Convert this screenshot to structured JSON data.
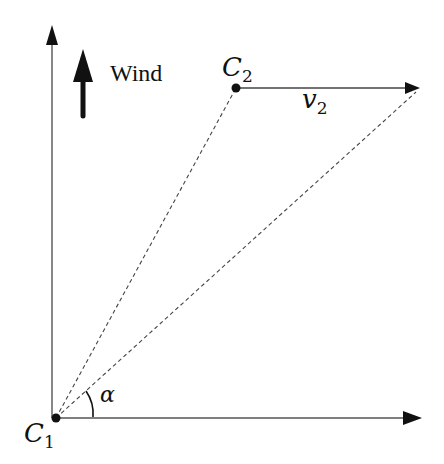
{
  "diagram": {
    "wind_label": "Wind",
    "points": {
      "c1": {
        "symbol": "C",
        "subscript": "1"
      },
      "c2": {
        "symbol": "C",
        "subscript": "2"
      }
    },
    "velocity": {
      "symbol": "v",
      "subscript": "2"
    },
    "angle": {
      "symbol": "α"
    },
    "colors": {
      "line": "#333333",
      "dashed": "#444444",
      "arrow": "#111111"
    }
  }
}
